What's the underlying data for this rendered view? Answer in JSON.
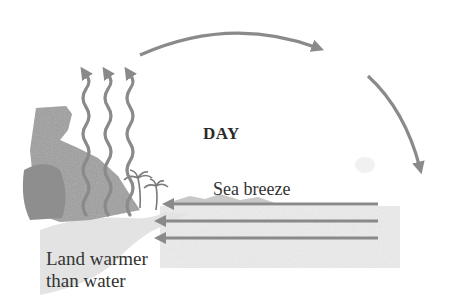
{
  "diagram": {
    "title": "DAY",
    "labels": {
      "time_of_day": "DAY",
      "breeze": "Sea breeze",
      "land_line1": "Land warmer",
      "land_line2": "than water"
    },
    "arrows": {
      "rising_heat": {
        "count": 3,
        "direction": "up",
        "style": "wavy"
      },
      "upper_flow": {
        "direction": "land-to-sea",
        "style": "curved"
      },
      "descending_flow": {
        "direction": "down over sea",
        "style": "curved"
      },
      "surface_breeze": {
        "count": 3,
        "direction": "sea-to-land",
        "style": "straight horizontal"
      }
    },
    "colors": {
      "arrow": "#8a8a8a",
      "text": "#2e2e2e",
      "land": "#9a9a9a",
      "water": "#ececec",
      "background": "#ffffff"
    }
  }
}
